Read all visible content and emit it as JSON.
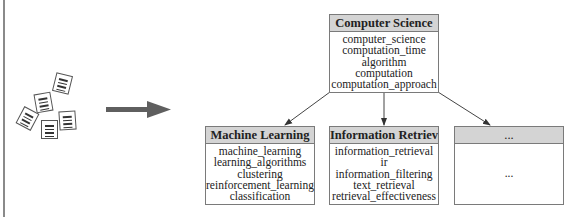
{
  "diagram": {
    "arrow": {
      "direction": "right",
      "color": "#5f5f5f"
    },
    "documents": {
      "count": 5,
      "icon": "document-icon"
    },
    "root": {
      "title": "Computer Science",
      "terms": [
        "computer_science",
        "computation_time",
        "algorithm",
        "computation",
        "computation_approach"
      ]
    },
    "children": [
      {
        "title": "Machine Learning",
        "terms": [
          "machine_learning",
          "learning_algorithms",
          "clustering",
          "reinforcement_learning",
          "classification"
        ]
      },
      {
        "title": "Information Retrieval",
        "terms": [
          "information_retrieval",
          "ir",
          "information_filtering",
          "text_retrieval",
          "retrieval_effectiveness"
        ]
      },
      {
        "title": "...",
        "terms": [
          "..."
        ]
      }
    ],
    "colors": {
      "header_bg": "#d4d4d4",
      "border": "#7a7a7a",
      "arrow": "#5f5f5f"
    }
  }
}
